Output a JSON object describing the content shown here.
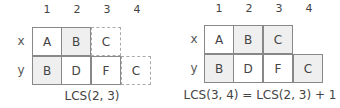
{
  "left": {
    "column_numbers": [
      "1",
      "2",
      "3",
      "4"
    ],
    "row_labels": [
      "x",
      "y"
    ],
    "row_x": [
      "A",
      "B",
      "C"
    ],
    "row_y": [
      "B",
      "D",
      "F",
      "C"
    ],
    "caption": "LCS(2, 3)"
  },
  "right": {
    "column_numbers": [
      "1",
      "2",
      "3",
      "4"
    ],
    "row_labels": [
      "x",
      "y"
    ],
    "row_x": [
      "A",
      "B",
      "C"
    ],
    "row_y": [
      "B",
      "D",
      "F",
      "C"
    ],
    "caption": "LCS(3, 4) = LCS(2, 3) + 1"
  },
  "colors": {
    "shaded": "#efefef",
    "border": "#888888",
    "dashed_border": "#aaaaaa"
  }
}
